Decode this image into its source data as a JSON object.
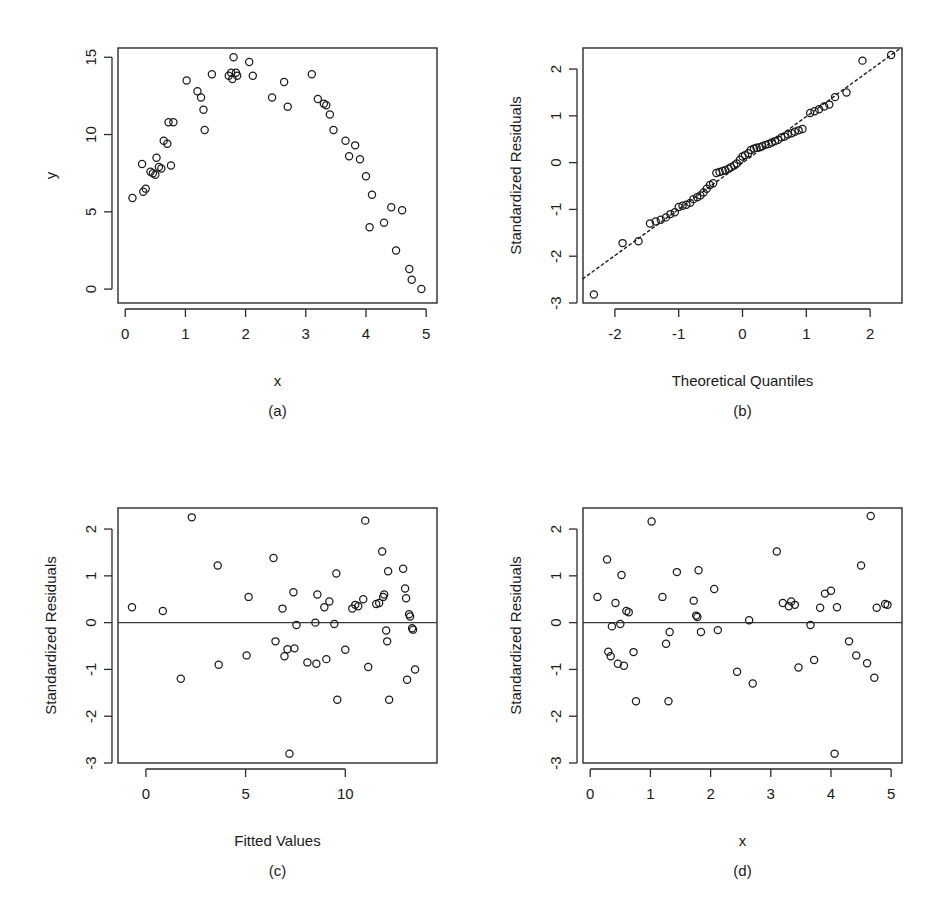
{
  "figure": {
    "layout": "2x2 grid of regression diagnostic plots",
    "background_color": "#ffffff",
    "point_color": "#1a1a1a",
    "axis_color": "#2b2b2b"
  },
  "panels": [
    {
      "id": "a",
      "caption": "(a)",
      "xlabel": "x",
      "ylabel": "y",
      "marker": "open-circle"
    },
    {
      "id": "b",
      "caption": "(b)",
      "xlabel": "Theoretical Quantiles",
      "ylabel": "Standardized Residuals",
      "marker": "open-circle"
    },
    {
      "id": "c",
      "caption": "(c)",
      "xlabel": "Fitted Values",
      "ylabel": "Standardized Residuals",
      "marker": "open-circle"
    },
    {
      "id": "d",
      "caption": "(d)",
      "xlabel": "x",
      "ylabel": "Standardized Residuals",
      "marker": "open-circle"
    }
  ],
  "chart_data": [
    {
      "type": "scatter",
      "panel": "a",
      "title": "",
      "xlabel": "x",
      "ylabel": "y",
      "xlim": [
        -0.12,
        5.18
      ],
      "ylim": [
        -0.9,
        15.6
      ],
      "xticks": [
        0,
        1,
        2,
        3,
        4,
        5
      ],
      "yticks": [
        0,
        5,
        10,
        15
      ],
      "grid": false,
      "legend": null,
      "points": [
        [
          0.12,
          5.9
        ],
        [
          0.28,
          8.1
        ],
        [
          0.3,
          6.3
        ],
        [
          0.34,
          6.5
        ],
        [
          0.42,
          7.6
        ],
        [
          0.46,
          7.5
        ],
        [
          0.5,
          7.4
        ],
        [
          0.52,
          8.5
        ],
        [
          0.56,
          7.9
        ],
        [
          0.6,
          7.8
        ],
        [
          0.64,
          9.6
        ],
        [
          0.7,
          9.4
        ],
        [
          0.72,
          10.8
        ],
        [
          0.76,
          8.0
        ],
        [
          0.8,
          10.8
        ],
        [
          1.02,
          13.5
        ],
        [
          1.2,
          12.8
        ],
        [
          1.26,
          12.4
        ],
        [
          1.3,
          11.6
        ],
        [
          1.32,
          10.3
        ],
        [
          1.44,
          13.9
        ],
        [
          1.72,
          13.8
        ],
        [
          1.76,
          14.0
        ],
        [
          1.78,
          13.6
        ],
        [
          1.8,
          15.0
        ],
        [
          1.84,
          14.0
        ],
        [
          1.86,
          13.8
        ],
        [
          2.06,
          14.7
        ],
        [
          2.12,
          13.8
        ],
        [
          2.44,
          12.4
        ],
        [
          2.64,
          13.4
        ],
        [
          2.7,
          11.8
        ],
        [
          3.1,
          13.9
        ],
        [
          3.2,
          12.3
        ],
        [
          3.3,
          12.0
        ],
        [
          3.34,
          11.9
        ],
        [
          3.4,
          11.3
        ],
        [
          3.46,
          10.3
        ],
        [
          3.66,
          9.6
        ],
        [
          3.72,
          8.6
        ],
        [
          3.82,
          9.3
        ],
        [
          3.9,
          8.4
        ],
        [
          4.0,
          7.3
        ],
        [
          4.06,
          4.0
        ],
        [
          4.1,
          6.1
        ],
        [
          4.3,
          4.3
        ],
        [
          4.42,
          5.3
        ],
        [
          4.5,
          2.5
        ],
        [
          4.6,
          5.1
        ],
        [
          4.72,
          1.3
        ],
        [
          4.76,
          0.6
        ],
        [
          4.92,
          0.0
        ]
      ]
    },
    {
      "type": "scatter",
      "panel": "b",
      "title": "",
      "xlabel": "Theoretical Quantiles",
      "ylabel": "Standardized Residuals",
      "xlim": [
        -2.5,
        2.5
      ],
      "ylim": [
        -3.0,
        2.45
      ],
      "xticks": [
        -2,
        -1,
        0,
        1,
        2
      ],
      "yticks": [
        -3,
        -2,
        -1,
        0,
        1,
        2
      ],
      "grid": false,
      "reference_line": {
        "style": "dotted",
        "x": [
          -2.5,
          2.45
        ],
        "y": [
          -2.48,
          2.42
        ]
      },
      "points": [
        [
          -2.33,
          -2.82
        ],
        [
          -1.88,
          -1.72
        ],
        [
          -1.63,
          -1.68
        ],
        [
          -1.45,
          -1.3
        ],
        [
          -1.36,
          -1.26
        ],
        [
          -1.28,
          -1.22
        ],
        [
          -1.2,
          -1.17
        ],
        [
          -1.13,
          -1.1
        ],
        [
          -1.06,
          -1.06
        ],
        [
          -1.0,
          -0.95
        ],
        [
          -0.94,
          -0.92
        ],
        [
          -0.88,
          -0.9
        ],
        [
          -0.82,
          -0.86
        ],
        [
          -0.77,
          -0.78
        ],
        [
          -0.71,
          -0.74
        ],
        [
          -0.66,
          -0.7
        ],
        [
          -0.61,
          -0.64
        ],
        [
          -0.56,
          -0.56
        ],
        [
          -0.51,
          -0.48
        ],
        [
          -0.46,
          -0.44
        ],
        [
          -0.41,
          -0.22
        ],
        [
          -0.36,
          -0.2
        ],
        [
          -0.31,
          -0.18
        ],
        [
          -0.27,
          -0.16
        ],
        [
          -0.22,
          -0.13
        ],
        [
          -0.18,
          -0.1
        ],
        [
          -0.13,
          -0.06
        ],
        [
          -0.09,
          -0.02
        ],
        [
          -0.04,
          0.06
        ],
        [
          0.0,
          0.13
        ],
        [
          0.04,
          0.16
        ],
        [
          0.09,
          0.2
        ],
        [
          0.13,
          0.27
        ],
        [
          0.18,
          0.3
        ],
        [
          0.22,
          0.32
        ],
        [
          0.27,
          0.33
        ],
        [
          0.31,
          0.35
        ],
        [
          0.36,
          0.38
        ],
        [
          0.41,
          0.4
        ],
        [
          0.46,
          0.43
        ],
        [
          0.51,
          0.46
        ],
        [
          0.56,
          0.49
        ],
        [
          0.61,
          0.54
        ],
        [
          0.66,
          0.56
        ],
        [
          0.71,
          0.6
        ],
        [
          0.77,
          0.63
        ],
        [
          0.82,
          0.66
        ],
        [
          0.88,
          0.69
        ],
        [
          0.94,
          0.72
        ],
        [
          1.06,
          1.06
        ],
        [
          1.13,
          1.1
        ],
        [
          1.2,
          1.14
        ],
        [
          1.28,
          1.2
        ],
        [
          1.36,
          1.24
        ],
        [
          1.45,
          1.4
        ],
        [
          1.63,
          1.5
        ],
        [
          1.88,
          2.18
        ],
        [
          2.33,
          2.3
        ]
      ]
    },
    {
      "type": "scatter",
      "panel": "c",
      "title": "",
      "xlabel": "Fitted Values",
      "ylabel": "Standardized Residuals",
      "xlim": [
        -1.4,
        14.6
      ],
      "ylim": [
        -3.0,
        2.45
      ],
      "xticks": [
        0,
        5,
        10
      ],
      "yticks": [
        -3,
        -2,
        -1,
        0,
        1,
        2
      ],
      "grid": false,
      "reference_line": {
        "style": "solid",
        "y": 0
      },
      "points": [
        [
          -0.7,
          0.33
        ],
        [
          0.85,
          0.25
        ],
        [
          1.75,
          -1.2
        ],
        [
          2.3,
          2.25
        ],
        [
          3.6,
          1.22
        ],
        [
          3.65,
          -0.9
        ],
        [
          5.05,
          -0.7
        ],
        [
          5.15,
          0.55
        ],
        [
          6.4,
          1.38
        ],
        [
          6.5,
          -0.4
        ],
        [
          6.85,
          0.3
        ],
        [
          6.95,
          -0.72
        ],
        [
          7.1,
          -0.57
        ],
        [
          7.2,
          -2.8
        ],
        [
          7.4,
          0.65
        ],
        [
          7.45,
          -0.55
        ],
        [
          7.55,
          -0.05
        ],
        [
          8.1,
          -0.85
        ],
        [
          8.5,
          0.0
        ],
        [
          8.55,
          -0.88
        ],
        [
          8.6,
          0.6
        ],
        [
          8.95,
          0.33
        ],
        [
          9.05,
          -0.78
        ],
        [
          9.2,
          0.45
        ],
        [
          9.45,
          -0.03
        ],
        [
          9.55,
          1.05
        ],
        [
          9.6,
          -1.65
        ],
        [
          10.0,
          -0.58
        ],
        [
          10.35,
          0.3
        ],
        [
          10.5,
          0.38
        ],
        [
          10.65,
          0.35
        ],
        [
          10.9,
          0.5
        ],
        [
          11.0,
          2.18
        ],
        [
          11.15,
          -0.95
        ],
        [
          11.55,
          0.4
        ],
        [
          11.7,
          0.42
        ],
        [
          11.85,
          1.52
        ],
        [
          11.9,
          0.55
        ],
        [
          11.95,
          0.6
        ],
        [
          12.05,
          -0.17
        ],
        [
          12.1,
          -0.4
        ],
        [
          12.15,
          1.1
        ],
        [
          12.2,
          -1.65
        ],
        [
          12.9,
          1.15
        ],
        [
          13.0,
          0.73
        ],
        [
          13.05,
          0.52
        ],
        [
          13.1,
          -1.22
        ],
        [
          13.2,
          0.18
        ],
        [
          13.25,
          0.13
        ],
        [
          13.35,
          -0.12
        ],
        [
          13.4,
          -0.15
        ],
        [
          13.5,
          -1.0
        ]
      ]
    },
    {
      "type": "scatter",
      "panel": "d",
      "title": "",
      "xlabel": "x",
      "ylabel": "Standardized Residuals",
      "xlim": [
        -0.12,
        5.18
      ],
      "ylim": [
        -3.0,
        2.45
      ],
      "xticks": [
        0,
        1,
        2,
        3,
        4,
        5
      ],
      "yticks": [
        -3,
        -2,
        -1,
        0,
        1,
        2
      ],
      "grid": false,
      "reference_line": {
        "style": "solid",
        "y": 0
      },
      "points": [
        [
          0.12,
          0.55
        ],
        [
          0.28,
          1.35
        ],
        [
          0.3,
          -0.62
        ],
        [
          0.34,
          -0.72
        ],
        [
          0.36,
          -0.08
        ],
        [
          0.42,
          0.42
        ],
        [
          0.46,
          -0.88
        ],
        [
          0.5,
          -0.03
        ],
        [
          0.52,
          1.02
        ],
        [
          0.56,
          -0.92
        ],
        [
          0.6,
          0.25
        ],
        [
          0.64,
          0.22
        ],
        [
          0.72,
          -0.63
        ],
        [
          0.76,
          -1.68
        ],
        [
          1.02,
          2.16
        ],
        [
          1.2,
          0.55
        ],
        [
          1.26,
          -0.45
        ],
        [
          1.3,
          -1.68
        ],
        [
          1.32,
          -0.2
        ],
        [
          1.44,
          1.08
        ],
        [
          1.72,
          0.47
        ],
        [
          1.76,
          0.15
        ],
        [
          1.78,
          0.12
        ],
        [
          1.8,
          1.12
        ],
        [
          1.84,
          -0.2
        ],
        [
          2.06,
          0.72
        ],
        [
          2.12,
          -0.16
        ],
        [
          2.44,
          -1.05
        ],
        [
          2.64,
          0.05
        ],
        [
          2.7,
          -1.3
        ],
        [
          3.1,
          1.52
        ],
        [
          3.2,
          0.42
        ],
        [
          3.3,
          0.35
        ],
        [
          3.34,
          0.45
        ],
        [
          3.4,
          0.38
        ],
        [
          3.46,
          -0.96
        ],
        [
          3.66,
          -0.05
        ],
        [
          3.72,
          -0.8
        ],
        [
          3.82,
          0.32
        ],
        [
          3.9,
          0.62
        ],
        [
          4.0,
          0.68
        ],
        [
          4.06,
          -2.8
        ],
        [
          4.1,
          0.33
        ],
        [
          4.3,
          -0.4
        ],
        [
          4.42,
          -0.7
        ],
        [
          4.5,
          1.22
        ],
        [
          4.6,
          -0.87
        ],
        [
          4.66,
          2.28
        ],
        [
          4.72,
          -1.18
        ],
        [
          4.76,
          0.32
        ],
        [
          4.9,
          0.4
        ],
        [
          4.94,
          0.38
        ]
      ]
    }
  ]
}
